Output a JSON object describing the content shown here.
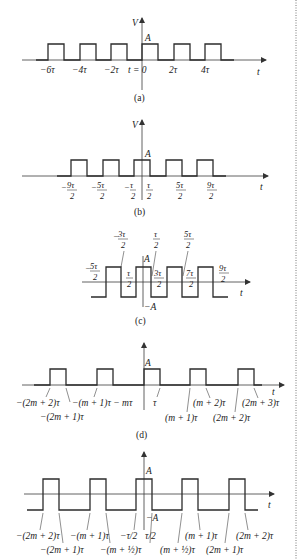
{
  "figures": [
    {
      "id": "a",
      "caption": "(a)",
      "y_axis_label": "V",
      "x_axis_label": "t",
      "amplitude_label": "A",
      "tick_labels": [
        "−6τ",
        "−4τ",
        "−2τ",
        "t = 0",
        "2τ",
        "4τ"
      ]
    },
    {
      "id": "b",
      "caption": "(b)",
      "y_axis_label": "V",
      "x_axis_label": "t",
      "amplitude_label": "A",
      "tick_labels": [
        {
          "sign": "−",
          "num": "9τ",
          "den": "2"
        },
        {
          "sign": "−",
          "num": "5τ",
          "den": "2"
        },
        {
          "sign": "−",
          "num": "τ",
          "den": "2"
        },
        {
          "sign": "",
          "num": "τ",
          "den": "2"
        },
        {
          "sign": "",
          "num": "5τ",
          "den": "2"
        },
        {
          "sign": "",
          "num": "9τ",
          "den": "2"
        }
      ]
    },
    {
      "id": "c",
      "caption": "(c)",
      "x_axis_label": "t",
      "amplitude_label": "A",
      "negative_amplitude_label": "−A",
      "tick_labels": [
        {
          "sign": "−",
          "num": "5τ",
          "den": "2"
        },
        {
          "sign": "−",
          "num": "3τ",
          "den": "2"
        },
        {
          "sign": "",
          "num": "τ",
          "den": "2"
        },
        {
          "sign": "",
          "num": "τ",
          "den": "2"
        },
        {
          "sign": "",
          "num": "3τ",
          "den": "2"
        },
        {
          "sign": "",
          "num": "5τ",
          "den": "2"
        },
        {
          "sign": "",
          "num": "7τ",
          "den": "2"
        },
        {
          "sign": "",
          "num": "9τ",
          "den": "2"
        }
      ]
    },
    {
      "id": "d",
      "caption": "(d)",
      "x_axis_label": "t",
      "amplitude_label": "A",
      "tick_labels": [
        "−(2m + 2)τ",
        "−(2m + 1)τ",
        "−(m + 1)τ − mτ",
        "τ",
        "(m + 1)τ",
        "(m + 2)τ",
        "(2m + 2)τ",
        "(2m + 3)τ"
      ]
    },
    {
      "id": "e",
      "x_axis_label": "t",
      "amplitude_label": "A",
      "negative_amplitude_label": "−A",
      "tick_labels": [
        "−(2m + 2)τ",
        "−(2m + 1)τ",
        "−(m + 1)τ",
        "−(m + ½)τ",
        "−τ/2",
        "τ/2",
        "(m + ½)τ",
        "(m + 1)τ",
        "(2m + 1)τ",
        "(2m + 2)τ"
      ]
    }
  ]
}
